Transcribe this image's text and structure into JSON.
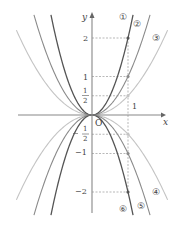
{
  "diagram": {
    "origin_label": "O",
    "x_axis_label": "x",
    "y_axis_label": "y",
    "x_unit_label": "1",
    "y_tick_labels": {
      "pos2": "2",
      "pos1": "1",
      "half_num": "1",
      "half_den": "2",
      "neg_half_num": "1",
      "neg_half_den": "2",
      "neg1": "−1",
      "neg2": "−2"
    },
    "curves": [
      {
        "id": "1",
        "label": "①",
        "a": 2,
        "color": "#555555"
      },
      {
        "id": "2",
        "label": "②",
        "a": 1,
        "color": "#8a8a8a"
      },
      {
        "id": "3",
        "label": "③",
        "a": 0.5,
        "color": "#c4c4c4"
      },
      {
        "id": "4",
        "label": "④",
        "a": -0.5,
        "color": "#c4c4c4"
      },
      {
        "id": "5",
        "label": "⑤",
        "a": -1,
        "color": "#8a8a8a"
      },
      {
        "id": "6",
        "label": "⑥",
        "a": -2,
        "color": "#555555"
      }
    ],
    "axes_color": "#888888",
    "guide_color": "#999999"
  }
}
